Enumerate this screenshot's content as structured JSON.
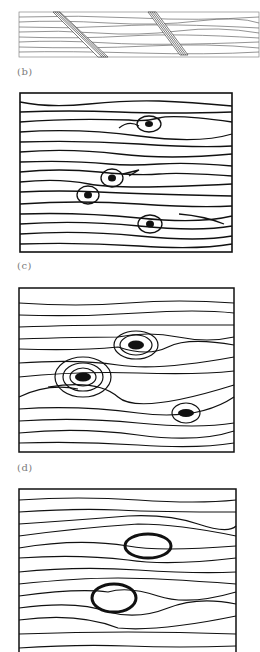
{
  "figure": {
    "panels": [
      {
        "id": "b",
        "label": "(b)",
        "description": "Longitudinal section of wood grain with two spike knots cutting diagonally"
      },
      {
        "id": "c",
        "label": "(c)",
        "description": "Wood grain with four small knots"
      },
      {
        "id": "d",
        "label": "(d)",
        "description": "Wood grain with three knots with concentric rings"
      },
      {
        "id": "e",
        "label": "",
        "description": "Wood grain with loose/encased round knots"
      }
    ]
  }
}
